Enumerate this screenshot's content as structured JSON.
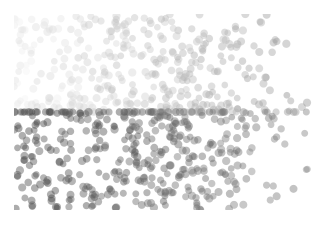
{
  "figure": {
    "width": 327,
    "height": 227,
    "background_color": "#ffffff",
    "title": "",
    "has_axes": false,
    "has_frame": false,
    "has_ticks": false,
    "has_gridlines": false,
    "has_legend": false,
    "has_colorbar": false
  },
  "plot_area": {
    "left": 14,
    "top": 14,
    "width": 298,
    "height": 196
  },
  "chart_data": {
    "type": "scatter",
    "title": "",
    "xlabel": "",
    "ylabel": "",
    "xlim": [
      0,
      1
    ],
    "ylim": [
      0,
      1
    ],
    "grid": false,
    "legend": null,
    "legend_position": "none",
    "axes_visible": false,
    "tick_labels_x": [],
    "tick_labels_y": [],
    "annotations": [],
    "marker": {
      "shape": "circle",
      "diameter_px": 7.4,
      "alpha": 0.45,
      "edge_color": "none",
      "clipped_at_plot_edges": true
    },
    "n_points": 820,
    "colormap": {
      "name": "grayscale",
      "description": "Marker gray level varies with position: two horizontal bands split at y_norm 0.50, each darkening from left to right.",
      "band_split_y_norm": 0.5,
      "upper_band": {
        "y_norm_range": [
          0.5,
          1.0
        ],
        "color_left": "#ececec",
        "color_right": "#9a9a9a"
      },
      "lower_band": {
        "y_norm_range": [
          0.0,
          0.5
        ],
        "color_left": "#4a4a4a",
        "color_right": "#8b8b8b"
      },
      "darkest_observed": "#3f3f3f",
      "lightest_observed": "#f0f0f0"
    },
    "density": {
      "description": "Uniform random scatter with heavy overlap; slightly denser toward the left half and along the band boundary.",
      "upper_band_points": 400,
      "lower_band_points": 420
    },
    "series": [
      {
        "name": "upper-band",
        "n": 400,
        "color_range": [
          "#ececec",
          "#9a9a9a"
        ]
      },
      {
        "name": "lower-band",
        "n": 420,
        "color_range": [
          "#4a4a4a",
          "#8b8b8b"
        ]
      }
    ]
  }
}
